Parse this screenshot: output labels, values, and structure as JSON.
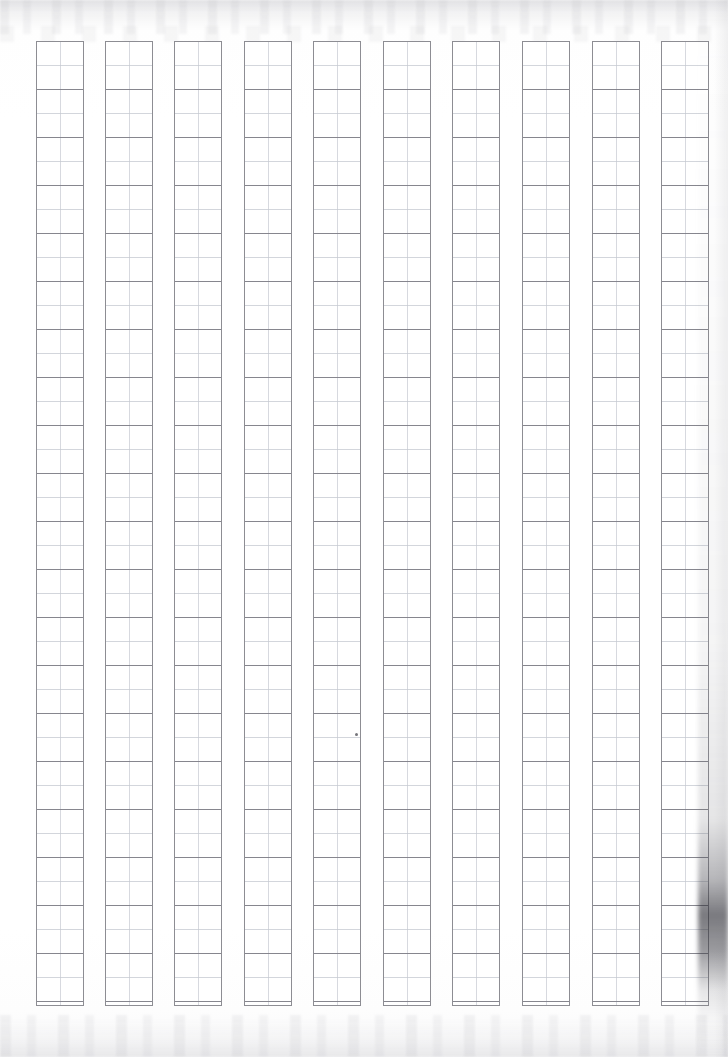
{
  "document": {
    "kind": "genko-yoshi-manuscript-paper",
    "title": "Genkō yōshi blank manuscript sheet",
    "description": "Scanned blank Japanese vertical-writing manuscript paper with ten empty character columns",
    "page_width": 728,
    "page_height": 1057,
    "background_color": "#fdfdfd",
    "content_text": ""
  },
  "grid": {
    "column_count": 10,
    "rows_per_column": 40,
    "blocks_per_column": 20,
    "cells_total": 400,
    "filled_cells": 0,
    "writing_direction": "vertical-right-to-left",
    "origin_x": 36,
    "origin_y": 41,
    "column_width": 48,
    "column_height": 965,
    "column_pitch": 70,
    "column_gap": 22,
    "cell_height": 24,
    "block_height": 48,
    "border_color": "#8d8d93",
    "block_line_color": "#808088",
    "cell_line_color": "#c4c8d0",
    "center_rule_color": "#cdd0d7",
    "cell_background": "#ffffff",
    "columns": [
      {
        "index": 1,
        "label": "column-1",
        "x": 36,
        "text": ""
      },
      {
        "index": 2,
        "label": "column-2",
        "x": 105,
        "text": ""
      },
      {
        "index": 3,
        "label": "column-3",
        "x": 174,
        "text": ""
      },
      {
        "index": 4,
        "label": "column-4",
        "x": 244,
        "text": ""
      },
      {
        "index": 5,
        "label": "column-5",
        "x": 313,
        "text": ""
      },
      {
        "index": 6,
        "label": "column-6",
        "x": 383,
        "text": ""
      },
      {
        "index": 7,
        "label": "column-7",
        "x": 452,
        "text": ""
      },
      {
        "index": 8,
        "label": "column-8",
        "x": 522,
        "text": ""
      },
      {
        "index": 9,
        "label": "column-9",
        "x": 592,
        "text": ""
      },
      {
        "index": 10,
        "label": "column-10",
        "x": 661,
        "text": ""
      }
    ]
  },
  "artifacts": {
    "ink_speck": {
      "name": "ink-speck",
      "x": 355,
      "y": 733,
      "size": 3,
      "color": "#5d5d63"
    },
    "edge_shadow": {
      "name": "page-edge-shadow",
      "side": "right",
      "peak_y": 915,
      "color": "#404048"
    },
    "scan_noise_top": {
      "name": "scan-noise-top",
      "height": 34
    },
    "scan_noise_bottom": {
      "name": "scan-noise-bottom",
      "height": 42
    }
  }
}
